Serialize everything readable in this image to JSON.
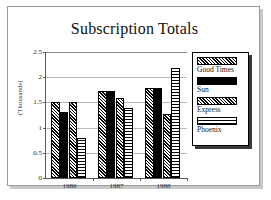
{
  "slide": {
    "title": "Subscription Totals"
  },
  "legend": {
    "position": "right",
    "items": [
      {
        "label": "Good Times",
        "pattern": "diagonal-hatch",
        "swatch_name": "legend-swatch-good-times"
      },
      {
        "label": "Sun",
        "pattern": "solid-black",
        "swatch_name": "legend-swatch-sun"
      },
      {
        "label": "Express",
        "pattern": "diagonal-hatch",
        "swatch_name": "legend-swatch-express"
      },
      {
        "label": "Phoenix",
        "pattern": "grid-crosshatch",
        "swatch_name": "legend-swatch-phoenix"
      }
    ]
  },
  "axes": {
    "ylabel": "(Thousands)",
    "yticks": [
      "0",
      "0.5",
      "1",
      "1.5",
      "2",
      "2.5"
    ],
    "ytick_values": [
      0,
      0.5,
      1,
      1.5,
      2,
      2.5
    ],
    "xticks": [
      "1986",
      "1987",
      "1988"
    ]
  },
  "chart_data": {
    "type": "bar",
    "title": "Subscription Totals",
    "xlabel": "",
    "ylabel": "(Thousands)",
    "ylim": [
      0,
      2.5
    ],
    "yticks": [
      0,
      0.5,
      1,
      1.5,
      2,
      2.5
    ],
    "grid": true,
    "legend_position": "right",
    "categories": [
      "1986",
      "1987",
      "1988"
    ],
    "series": [
      {
        "name": "Good Times",
        "pattern": "diagonal-hatch",
        "values": [
          1.5,
          1.72,
          1.78
        ]
      },
      {
        "name": "Sun",
        "pattern": "solid-black",
        "values": [
          1.3,
          1.72,
          1.78
        ]
      },
      {
        "name": "Express",
        "pattern": "diagonal-hatch",
        "values": [
          1.5,
          1.58,
          1.28
        ]
      },
      {
        "name": "Phoenix",
        "pattern": "grid-crosshatch",
        "values": [
          0.8,
          1.38,
          2.18
        ]
      }
    ]
  },
  "colors": {
    "background": "#ffffff",
    "frame_border": "#9a9a9a",
    "axis": "#5a5a5a",
    "gridline": "#b9b9b9",
    "ink": "#000000"
  }
}
